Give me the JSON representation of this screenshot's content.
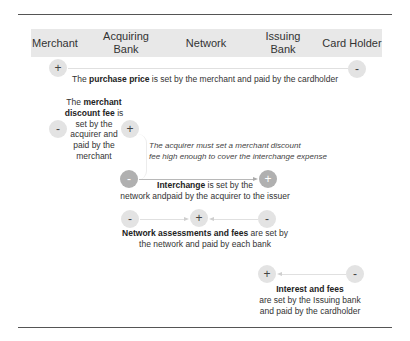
{
  "header": {
    "columns": [
      {
        "label": "Merchant"
      },
      {
        "label": "Acquiring\nBank",
        "line1": "Acquiring",
        "line2": "Bank"
      },
      {
        "label": "Network"
      },
      {
        "label": "Issuing\nBank",
        "line1": "Issuing",
        "line2": "Bank"
      },
      {
        "label": "Card Holder"
      }
    ]
  },
  "flows": {
    "purchase_price": {
      "left_symbol": "+",
      "right_symbol": "-",
      "prefix": "The ",
      "bold": "purchase price",
      "suffix": " is set by the merchant and paid by the cardholder"
    },
    "merchant_discount_fee": {
      "left_symbol": "-",
      "right_symbol": "+",
      "line1_prefix": "The ",
      "line1_bold": "merchant",
      "line2_bold": "discount fee",
      "line2_suffix": " is",
      "line3": "set by the",
      "line4": "acquirer and",
      "line5": "paid by the",
      "line6": "merchant"
    },
    "note": {
      "line1": "The acquirer must set a merchant discount",
      "line2": "fee high enough to cover the interchange expense"
    },
    "interchange": {
      "left_symbol": "-",
      "right_symbol": "+",
      "bold": "Interchange",
      "line1_suffix": " is set by the",
      "line2": "network andpaid by the acquirer to the issuer"
    },
    "network_assessments": {
      "left_symbol": "-",
      "center_symbol": "+",
      "right_symbol": "-",
      "bold": "Network assessments and fees",
      "line1_suffix": " are set by",
      "line2": "the network and paid by each bank"
    },
    "interest_fees": {
      "left_symbol": "+",
      "right_symbol": "-",
      "bold": "Interest and fees",
      "line2": "are set by the Issuing bank",
      "line3": "and paid by the cardholder"
    }
  },
  "colors": {
    "header_bg": "#e8e8e8",
    "circle_light": "#e3e3e3",
    "circle_dark": "#b0b0b0",
    "rule": "#555555"
  }
}
